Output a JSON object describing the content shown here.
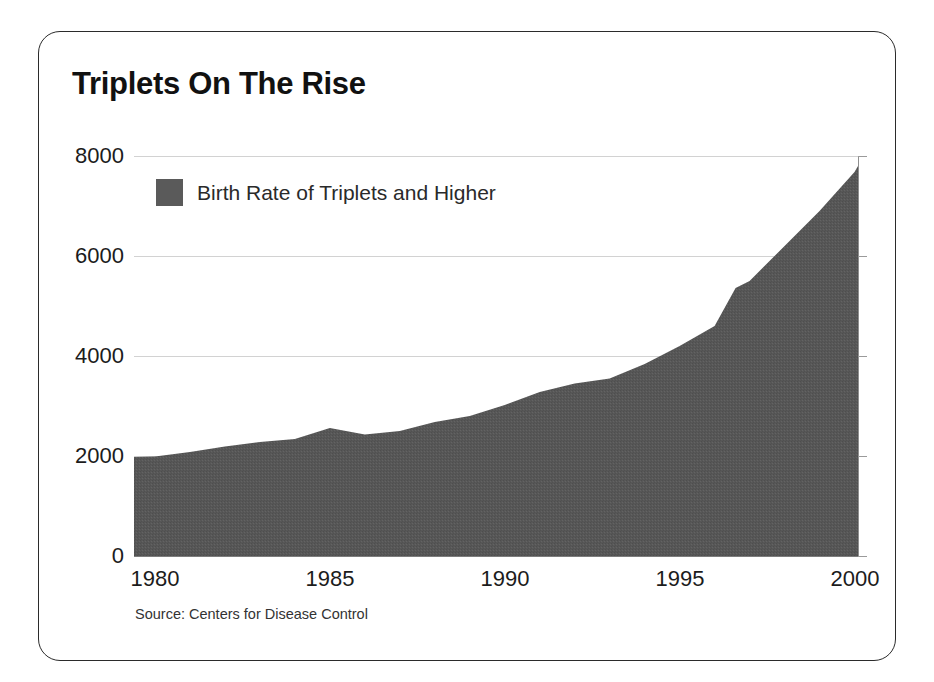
{
  "card": {
    "title": "Triplets On The Rise",
    "source_note": "Source: Centers for Disease Control",
    "border_color": "#2b2b2b",
    "background": "#ffffff"
  },
  "legend": {
    "label": "Birth Rate of Triplets and Higher",
    "swatch_color": "#5a5a5a",
    "position": "inside-top-left"
  },
  "chart_data": {
    "type": "area",
    "title": "Triplets On The Rise",
    "xlabel": "",
    "ylabel": "",
    "series_name": "Birth Rate of Triplets and Higher",
    "fill_color": "#575757",
    "grid": true,
    "grid_color": "#d2d2d2",
    "xlim": [
      1979.4,
      2000.1
    ],
    "ylim": [
      0,
      8000
    ],
    "xticks": [
      1980,
      1985,
      1990,
      1995,
      2000
    ],
    "xtick_labels": [
      "1980",
      "1985",
      "1990",
      "1995",
      "2000"
    ],
    "yticks": [
      0,
      2000,
      4000,
      6000,
      8000
    ],
    "ytick_labels": [
      "0",
      "2000",
      "4000",
      "6000",
      "8000"
    ],
    "x": [
      1979.4,
      1980,
      1981,
      1982,
      1983,
      1984,
      1985,
      1986,
      1987,
      1988,
      1989,
      1990,
      1991,
      1992,
      1993,
      1994,
      1995,
      1996,
      1996.6,
      1997,
      1998,
      1999,
      2000,
      2000.1
    ],
    "values": [
      1980,
      1990,
      2080,
      2190,
      2280,
      2340,
      2560,
      2430,
      2500,
      2680,
      2800,
      3020,
      3280,
      3450,
      3550,
      3840,
      4200,
      4600,
      5360,
      5500,
      6200,
      6900,
      7680,
      7800
    ],
    "units": "births per year"
  }
}
